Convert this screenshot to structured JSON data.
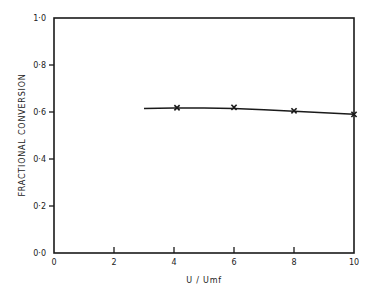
{
  "chart_data": {
    "type": "line",
    "title": "",
    "xlabel": "U / Umf",
    "ylabel": "FRACTIONAL CONVERSION",
    "xlim": [
      0,
      10
    ],
    "ylim": [
      0.0,
      1.0
    ],
    "x_ticks": [
      0,
      2,
      4,
      6,
      8,
      10
    ],
    "x_tick_labels": [
      "0",
      "2",
      "4",
      "6",
      "8",
      "10"
    ],
    "y_ticks": [
      0.0,
      0.2,
      0.4,
      0.6,
      0.8,
      1.0
    ],
    "y_tick_labels": [
      "0·0",
      "0·2",
      "0·4",
      "0·6",
      "0·8",
      "1·0"
    ],
    "grid": false,
    "legend": null,
    "series": [
      {
        "name": "experimental",
        "style": "markers",
        "marker": "x",
        "x": [
          4.1,
          6.0,
          8.0,
          10.0
        ],
        "y": [
          0.618,
          0.62,
          0.605,
          0.59
        ]
      },
      {
        "name": "fitted curve",
        "style": "line",
        "x": [
          3.0,
          4.0,
          5.0,
          6.0,
          7.0,
          8.0,
          9.0,
          10.0
        ],
        "y": [
          0.615,
          0.617,
          0.617,
          0.615,
          0.61,
          0.603,
          0.597,
          0.59
        ]
      }
    ]
  },
  "colors": {
    "ink": "#1a1a1a",
    "background": "#ffffff"
  }
}
